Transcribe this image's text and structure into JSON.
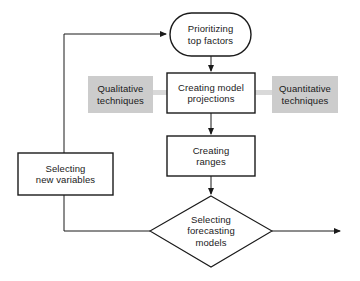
{
  "diagram": {
    "background_color": "#ffffff",
    "line_color": "#1a1a1a",
    "accent_gray": "#cccccc",
    "connector_gray": "#d9d9d9",
    "nodes": {
      "prioritizing": {
        "shape": "rounded-rectangle",
        "line1": "Prioritizing",
        "line2": "top factors"
      },
      "creating_model_projections": {
        "shape": "rectangle",
        "line1": "Creating model",
        "line2": "projections"
      },
      "qualitative": {
        "shape": "gray-box",
        "line1": "Qualitative",
        "line2": "techniques"
      },
      "quantitative": {
        "shape": "gray-box",
        "line1": "Quantitative",
        "line2": "techniques"
      },
      "creating_ranges": {
        "shape": "rectangle",
        "line1": "Creating",
        "line2": "ranges"
      },
      "selecting_new_variables": {
        "shape": "rectangle",
        "line1": "Selecting",
        "line2": "new variables"
      },
      "selecting_forecasting_models": {
        "shape": "diamond",
        "line1": "Selecting",
        "line2": "forecasting",
        "line3": "models"
      }
    },
    "connectors": [
      {
        "name": "prioritizing-to-projections",
        "type": "arrow-down"
      },
      {
        "name": "qualitative-to-projections",
        "type": "gray-bar"
      },
      {
        "name": "quantitative-to-projections",
        "type": "gray-bar"
      },
      {
        "name": "projections-to-ranges",
        "type": "arrow-down"
      },
      {
        "name": "ranges-to-decision",
        "type": "arrow-down"
      },
      {
        "name": "decision-to-new-variables-loop",
        "type": "line-left-up"
      },
      {
        "name": "new-variables-to-prioritizing",
        "type": "arrow-right"
      },
      {
        "name": "decision-exit",
        "type": "arrow-right"
      }
    ]
  }
}
